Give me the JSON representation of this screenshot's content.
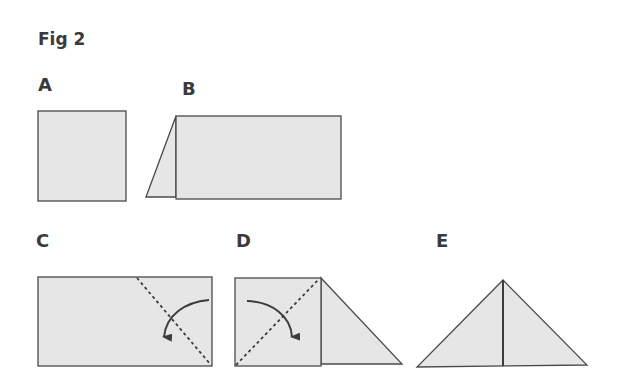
{
  "figure": {
    "title": "Fig 2",
    "colors": {
      "paper_fill": "#e6e6e6",
      "outline": "#4a4a4a",
      "arrow": "#3c3c3c",
      "label": "#3a3a3a",
      "background": "#ffffff"
    },
    "steps": [
      {
        "label": "A",
        "description": "square sheet of paper"
      },
      {
        "label": "B",
        "description": "paper with left edge folded back, forming a slanted flap"
      },
      {
        "label": "C",
        "description": "rectangle with diagonal dashed fold line at right, arrow indicating fold down-left"
      },
      {
        "label": "D",
        "description": "square with diagonal dashed fold line and folded triangle flap at right, arrow indicating fold down-right"
      },
      {
        "label": "E",
        "description": "finished triangle with vertical center crease"
      }
    ]
  }
}
